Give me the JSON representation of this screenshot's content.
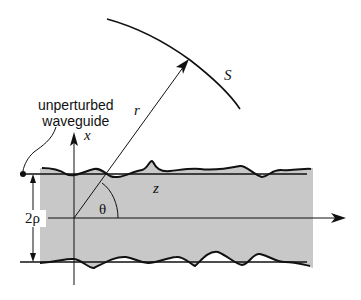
{
  "diagram": {
    "labels": {
      "caption_line1": "unperturbed",
      "caption_line2": "waveguide",
      "x_axis": "x",
      "z_axis": "z",
      "radius": "r",
      "angle": "θ",
      "surface": "S",
      "width": "2ρ"
    },
    "colors": {
      "core_fill": "#c8c8c8",
      "stroke": "#111111"
    }
  }
}
